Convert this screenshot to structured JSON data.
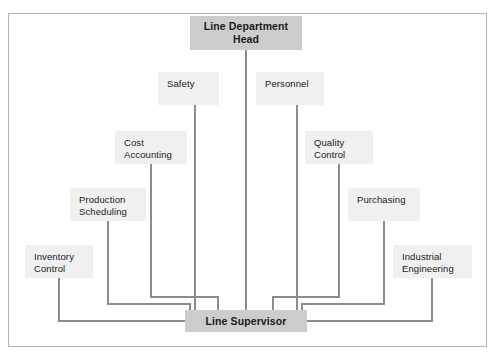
{
  "diagram": {
    "type": "organization-chart",
    "colors": {
      "primary_box_fill": "#cccccc",
      "secondary_box_fill": "#f0f0f0",
      "connector_line": "#8c8c8c",
      "frame_border": "#b4b4b4",
      "text": "#1a1a1a",
      "page_background": "#ffffff"
    },
    "nodes": {
      "head": {
        "label": "Line Department\nHead",
        "emphasis": "primary"
      },
      "supervisor": {
        "label": "Line Supervisor",
        "emphasis": "primary"
      },
      "safety": {
        "label": "Safety",
        "emphasis": "secondary"
      },
      "personnel": {
        "label": "Personnel",
        "emphasis": "secondary"
      },
      "cost_accounting": {
        "label": "Cost\nAccounting",
        "emphasis": "secondary"
      },
      "quality_control": {
        "label": "Quality\nControl",
        "emphasis": "secondary"
      },
      "production_scheduling": {
        "label": "Production\nScheduling",
        "emphasis": "secondary"
      },
      "purchasing": {
        "label": "Purchasing",
        "emphasis": "secondary"
      },
      "inventory_control": {
        "label": "Inventory\nControl",
        "emphasis": "secondary"
      },
      "industrial_engineering": {
        "label": "Industrial\nEngineering",
        "emphasis": "secondary"
      }
    },
    "connections": [
      {
        "from": "head",
        "to": "supervisor",
        "style": "straight-vertical"
      },
      {
        "from": "safety",
        "to": "supervisor",
        "style": "straight-vertical"
      },
      {
        "from": "personnel",
        "to": "supervisor",
        "style": "straight-vertical"
      },
      {
        "from": "cost_accounting",
        "to": "supervisor",
        "style": "elbow"
      },
      {
        "from": "quality_control",
        "to": "supervisor",
        "style": "elbow"
      },
      {
        "from": "production_scheduling",
        "to": "supervisor",
        "style": "elbow"
      },
      {
        "from": "purchasing",
        "to": "supervisor",
        "style": "elbow"
      },
      {
        "from": "inventory_control",
        "to": "supervisor",
        "style": "elbow-horizontal"
      },
      {
        "from": "industrial_engineering",
        "to": "supervisor",
        "style": "elbow-horizontal"
      }
    ]
  }
}
